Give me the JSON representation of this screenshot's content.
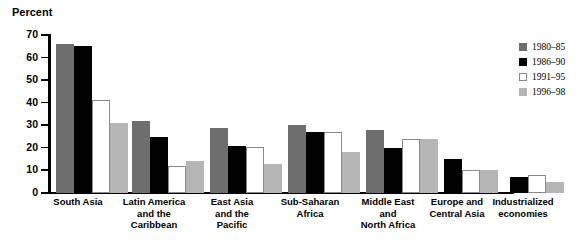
{
  "chart": {
    "ylabel": "Percent",
    "ytick_labels": [
      "70",
      "60",
      "50",
      "40",
      "30",
      "20",
      "10",
      "0"
    ]
  },
  "legend": {
    "items": [
      {
        "label": "1980–85",
        "color": "#6e6e6e",
        "swatch": "legend-swatch-1980-85"
      },
      {
        "label": "1986–90",
        "color": "#000000",
        "swatch": "legend-swatch-1986-90"
      },
      {
        "label": "1991–95",
        "color": "#ffffff",
        "swatch": "legend-swatch-1991-95"
      },
      {
        "label": "1996–98",
        "color": "#b5b5b5",
        "swatch": "legend-swatch-1996-98"
      }
    ]
  },
  "categories_display": [
    [
      "South Asia"
    ],
    [
      "Latin America",
      "and the",
      "Caribbean"
    ],
    [
      "East Asia",
      "and the",
      "Pacific"
    ],
    [
      "Sub-Saharan",
      "Africa"
    ],
    [
      "Middle East",
      "and",
      "North Africa"
    ],
    [
      "Europe and",
      "Central Asia"
    ],
    [
      "Industrialized",
      "economies"
    ]
  ],
  "chart_data": {
    "type": "bar",
    "title": "",
    "subtitle": "",
    "xlabel": "",
    "ylabel": "Percent",
    "ylim": [
      0,
      70
    ],
    "yticks": [
      0,
      10,
      20,
      30,
      40,
      50,
      60,
      70
    ],
    "grid": false,
    "legend_position": "right",
    "categories": [
      "South Asia",
      "Latin America and the Caribbean",
      "East Asia and the Pacific",
      "Sub-Saharan Africa",
      "Middle East and North Africa",
      "Europe and Central Asia",
      "Industrialized economies"
    ],
    "series": [
      {
        "name": "1980–85",
        "color": "#6e6e6e",
        "values": [
          66,
          32,
          29,
          30,
          28,
          null,
          null
        ]
      },
      {
        "name": "1986–90",
        "color": "#000000",
        "values": [
          65,
          25,
          21,
          27,
          20,
          15,
          7
        ]
      },
      {
        "name": "1991–95",
        "color": "#ffffff",
        "values": [
          41,
          12,
          20.5,
          27,
          24,
          10,
          8
        ]
      },
      {
        "name": "1996–98",
        "color": "#b5b5b5",
        "values": [
          31,
          14,
          13,
          18,
          24,
          10,
          5
        ]
      }
    ]
  }
}
